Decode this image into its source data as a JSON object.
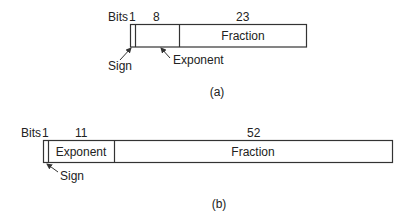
{
  "diagram": {
    "a": {
      "caption": "(a)",
      "bits_label": "Bits",
      "field_widths": {
        "sign": "1",
        "exponent": "8",
        "fraction": "23"
      },
      "field_labels": {
        "sign": "Sign",
        "exponent": "Exponent",
        "fraction": "Fraction"
      }
    },
    "b": {
      "caption": "(b)",
      "bits_label": "Bits",
      "field_widths": {
        "sign": "1",
        "exponent": "11",
        "fraction": "52"
      },
      "field_labels": {
        "sign": "Sign",
        "exponent": "Exponent",
        "fraction": "Fraction"
      }
    },
    "colors": {
      "line": "#333333",
      "text": "#222222",
      "background": "#ffffff"
    }
  }
}
